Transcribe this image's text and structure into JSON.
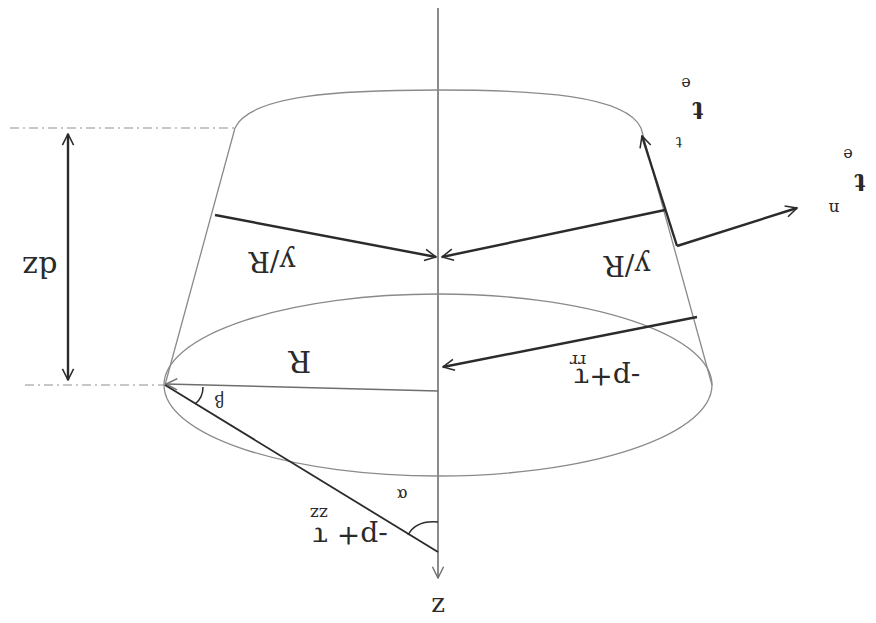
{
  "diagram": {
    "orientation": "upside-down",
    "labels": {
      "axis": "z",
      "height": "dz",
      "radius": "R",
      "hoop_left": "y/R",
      "hoop_right": "y/R",
      "radial_stress": "-p+τ",
      "radial_stress_sub": "rr",
      "axial_stress": "-p+ τ",
      "axial_stress_sub": "zz",
      "angle_alpha": "α",
      "angle_beta": "β",
      "tangent_vector": "t",
      "tangent_sup": "e",
      "tangent_sub": "t",
      "normal_vector": "t",
      "normal_sup": "e",
      "normal_sub": "n"
    },
    "colors": {
      "background": "#ffffff",
      "ink": "#2b2b2b",
      "thin_line": "#8a8a8a",
      "axis": "#6e6e6e"
    }
  }
}
